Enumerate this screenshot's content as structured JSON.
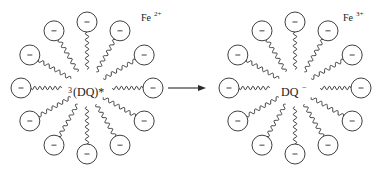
{
  "diagram": {
    "type": "micelle-electron-transfer",
    "left_micelle": {
      "center_label_prefix": "3",
      "center_label": "(DQ)*",
      "ion_label": "Fe",
      "ion_charge": "2+",
      "surfactant_count": 12,
      "headgroup_symbol": "−"
    },
    "arrow": {
      "direction": "right"
    },
    "right_micelle": {
      "center_label": "DQ",
      "center_charge": "−",
      "ion_label": "Fe",
      "ion_charge": "3+",
      "surfactant_count": 12,
      "headgroup_symbol": "−"
    },
    "colors": {
      "line": "#2a2a2a",
      "background": "#ffffff"
    }
  }
}
